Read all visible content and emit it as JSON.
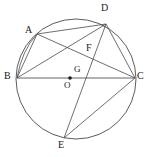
{
  "figure": {
    "type": "euclidean-geometry-diagram",
    "canvas": {
      "width": 151,
      "height": 157,
      "background": "#ffffff"
    },
    "stroke_color": "#4a4a4a",
    "diameter_color": "#999999",
    "label_color": "#1a1a1a",
    "circle": {
      "name": "main-circle",
      "center_label": "O",
      "cx": 76,
      "cy": 79,
      "r": 60,
      "stroke": "#4a4a4a",
      "stroke_width": 0.9,
      "fill": "none"
    },
    "center_point": {
      "label": "O",
      "x": 70,
      "y": 78,
      "dot_radius": 1.8
    },
    "points": [
      {
        "id": "A",
        "label": "A",
        "x": 37,
        "y": 34,
        "label_x": 25,
        "label_y": 27
      },
      {
        "id": "B",
        "label": "B",
        "x": 17,
        "y": 78,
        "label_x": 5,
        "label_y": 72
      },
      {
        "id": "C",
        "label": "C",
        "x": 135,
        "y": 78,
        "label_x": 138,
        "label_y": 72
      },
      {
        "id": "D",
        "label": "D",
        "x": 106,
        "y": 24,
        "label_x": 102,
        "label_y": 4
      },
      {
        "id": "E",
        "label": "E",
        "x": 64,
        "y": 138,
        "label_x": 59,
        "label_y": 141
      },
      {
        "id": "F",
        "label": "F",
        "x": 86,
        "y": 56,
        "label_x": 87,
        "label_y": 44
      },
      {
        "id": "G",
        "label": "G",
        "x": 76,
        "y": 78,
        "label_x": 76,
        "label_y": 68
      }
    ],
    "segments": [
      {
        "id": "AB",
        "name": "chord-a-b",
        "from": "A",
        "to": "B",
        "x1": 37,
        "y1": 34,
        "x2": 17,
        "y2": 78
      },
      {
        "id": "AD",
        "name": "chord-a-d",
        "from": "A",
        "to": "D",
        "x1": 37,
        "y1": 34,
        "x2": 106,
        "y2": 24
      },
      {
        "id": "AC",
        "name": "chord-a-c",
        "from": "A",
        "to": "C",
        "x1": 37,
        "y1": 34,
        "x2": 135,
        "y2": 78
      },
      {
        "id": "BD",
        "name": "chord-b-d",
        "from": "B",
        "to": "D",
        "x1": 17,
        "y1": 78,
        "x2": 106,
        "y2": 24
      },
      {
        "id": "BC",
        "name": "diameter-b-c",
        "from": "B",
        "to": "C",
        "x1": 17,
        "y1": 78,
        "x2": 135,
        "y2": 78,
        "is_diameter": true
      },
      {
        "id": "DC",
        "name": "chord-d-c",
        "from": "D",
        "to": "C",
        "x1": 106,
        "y1": 24,
        "x2": 135,
        "y2": 78
      },
      {
        "id": "DE",
        "name": "chord-d-e",
        "from": "D",
        "to": "E",
        "x1": 106,
        "y1": 24,
        "x2": 64,
        "y2": 138
      },
      {
        "id": "EC",
        "name": "chord-e-c",
        "from": "E",
        "to": "C",
        "x1": 64,
        "y1": 138,
        "x2": 135,
        "y2": 78
      }
    ],
    "arcs": [
      {
        "id": "arcAB",
        "name": "arc-a-b",
        "path": "M 37 34 Q 22 50 17 78"
      }
    ],
    "intersections": [
      {
        "label": "F",
        "of": [
          "AC",
          "DE"
        ],
        "x": 86,
        "y": 56
      },
      {
        "label": "G",
        "of": [
          "BC",
          "DE"
        ],
        "x": 76,
        "y": 78
      }
    ],
    "labels": {
      "A": "A",
      "B": "B",
      "C": "C",
      "D": "D",
      "E": "E",
      "F": "F",
      "G": "G",
      "O": "O"
    }
  }
}
